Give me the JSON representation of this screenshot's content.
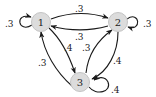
{
  "diagram": {
    "type": "markov-chain",
    "nodes": [
      {
        "id": "1",
        "label": "1"
      },
      {
        "id": "2",
        "label": "2"
      },
      {
        "id": "3",
        "label": "3"
      }
    ],
    "edges": [
      {
        "from": "1",
        "to": "1",
        "label": ".3"
      },
      {
        "from": "1",
        "to": "2",
        "label": ".3"
      },
      {
        "from": "2",
        "to": "1",
        "label": ".3"
      },
      {
        "from": "2",
        "to": "2",
        "label": ".3"
      },
      {
        "from": "1",
        "to": "3",
        "label": ".4"
      },
      {
        "from": "3",
        "to": "1",
        "label": ".3"
      },
      {
        "from": "3",
        "to": "2",
        "label": ".3"
      },
      {
        "from": "2",
        "to": "3",
        "label": ".4"
      },
      {
        "from": "3",
        "to": "3",
        "label": ".4"
      }
    ],
    "colors": {
      "node_fill": "#dcdcdc",
      "edge": "#1a1a1a",
      "text": "#222222"
    }
  }
}
